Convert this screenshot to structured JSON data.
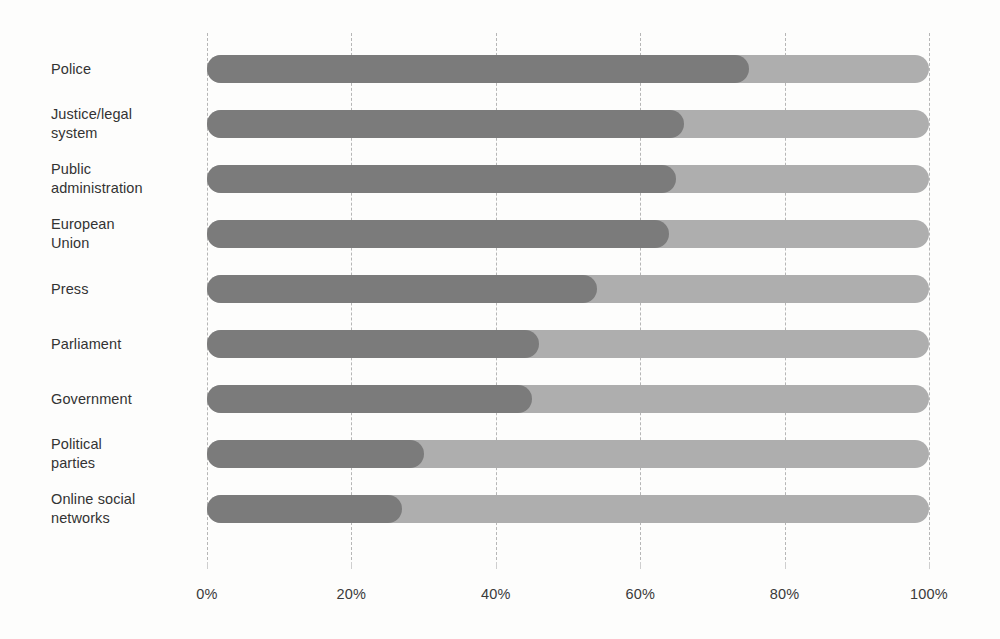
{
  "chart_data": {
    "type": "bar",
    "orientation": "horizontal",
    "stacked": true,
    "title": "",
    "subtitle": "",
    "xlabel": "",
    "ylabel": "",
    "xlim": [
      0,
      100
    ],
    "grid": true,
    "legend": null,
    "categories": [
      "Police",
      "Justice/legal system",
      "Public administration",
      "European Union",
      "Press",
      "Parliament",
      "Government",
      "Political parties",
      "Online social networks"
    ],
    "category_lines": [
      [
        "Police"
      ],
      [
        "Justice/legal",
        "system"
      ],
      [
        "Public",
        "administration"
      ],
      [
        "European",
        "Union"
      ],
      [
        "Press"
      ],
      [
        "Parliament"
      ],
      [
        "Government"
      ],
      [
        "Political",
        "parties"
      ],
      [
        "Online social",
        "networks"
      ]
    ],
    "series": [
      {
        "name": "dark-segment",
        "color": "#7b7b7b",
        "values": [
          75,
          66,
          65,
          64,
          54,
          46,
          45,
          30,
          27
        ]
      },
      {
        "name": "light-segment",
        "color": "#aeaeae",
        "values": [
          25,
          34,
          35,
          36,
          46,
          54,
          55,
          70,
          73
        ]
      }
    ],
    "x_ticks": [
      0,
      20,
      40,
      60,
      80,
      100
    ],
    "x_tick_labels": [
      "0%",
      "20%",
      "40%",
      "60%",
      "80%",
      "100%"
    ]
  },
  "colors": {
    "background": "#fdfdfc",
    "bar_dark": "#7b7b7b",
    "bar_light": "#aeaeae",
    "gridline": "#b6b6b6",
    "text": "#3a3a3a"
  }
}
